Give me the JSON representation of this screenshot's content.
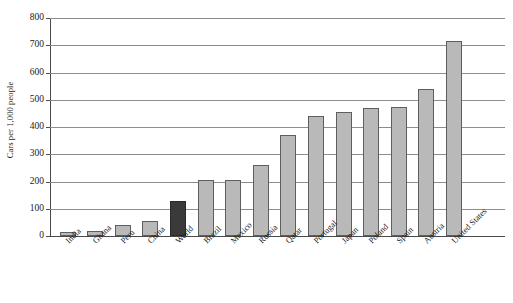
{
  "chart_data": {
    "type": "bar",
    "title": "",
    "xlabel": "",
    "ylabel": "Cars per 1,000 people",
    "ylim": [
      0,
      800
    ],
    "ytick_labels": [
      "800",
      "700",
      "600",
      "500",
      "400",
      "300",
      "200",
      "100",
      "0"
    ],
    "ytick_values": [
      800,
      700,
      600,
      500,
      400,
      300,
      200,
      100,
      0
    ],
    "grid": true,
    "legend": "none",
    "highlight_category": "World",
    "colors": {
      "bar_fill": "#b9b9b9",
      "bar_border": "#5e5e5e",
      "highlight_fill": "#3a3a3a",
      "highlight_border": "#2a2a2a",
      "gridline": "#8d8d8d",
      "axis": "#4a4a4a",
      "background": "#ffffff",
      "text": "#1a1a1a"
    },
    "categories": [
      "India",
      "Ghana",
      "Peru",
      "China",
      "World",
      "Brazil",
      "Mexico",
      "Russia",
      "Qatar",
      "Portugal",
      "Japan",
      "Poland",
      "Spain",
      "Austria",
      "United States"
    ],
    "values": [
      15,
      20,
      40,
      55,
      130,
      205,
      205,
      260,
      370,
      440,
      455,
      470,
      475,
      540,
      715
    ],
    "bars": [
      {
        "label": "India",
        "value": 15,
        "highlight": false
      },
      {
        "label": "Ghana",
        "value": 20,
        "highlight": false
      },
      {
        "label": "Peru",
        "value": 40,
        "highlight": false
      },
      {
        "label": "China",
        "value": 55,
        "highlight": false
      },
      {
        "label": "World",
        "value": 130,
        "highlight": true
      },
      {
        "label": "Brazil",
        "value": 205,
        "highlight": false
      },
      {
        "label": "Mexico",
        "value": 205,
        "highlight": false
      },
      {
        "label": "Russia",
        "value": 260,
        "highlight": false
      },
      {
        "label": "Qatar",
        "value": 370,
        "highlight": false
      },
      {
        "label": "Portugal",
        "value": 440,
        "highlight": false
      },
      {
        "label": "Japan",
        "value": 455,
        "highlight": false
      },
      {
        "label": "Poland",
        "value": 470,
        "highlight": false
      },
      {
        "label": "Spain",
        "value": 475,
        "highlight": false
      },
      {
        "label": "Austria",
        "value": 540,
        "highlight": false
      },
      {
        "label": "United States",
        "value": 715,
        "highlight": false
      }
    ]
  }
}
